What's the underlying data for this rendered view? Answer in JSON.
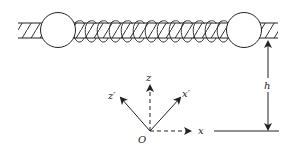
{
  "diagram": {
    "type": "physics-mechanics",
    "components": {
      "rod": {
        "hatched": true
      },
      "beads": [
        {
          "id": "left-bead"
        },
        {
          "id": "right-bead"
        }
      ],
      "spring": {
        "coil_count": 13
      }
    },
    "labels": {
      "z": "z",
      "z_prime": "z′",
      "x_prime": "x′",
      "x": "x",
      "origin": "O",
      "height": "h"
    },
    "colors": {
      "stroke": "#222222",
      "background": "#ffffff"
    }
  }
}
